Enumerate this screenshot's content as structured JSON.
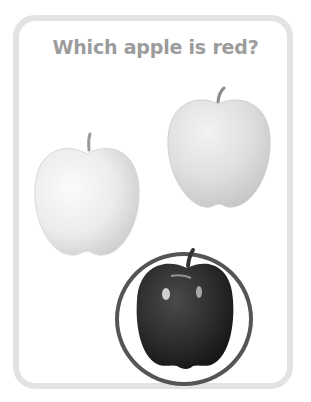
{
  "question": "Which apple is red?",
  "options": [
    {
      "id": "apple-1",
      "label": "pale apple (left)",
      "color": "#e8e8e8",
      "selected": false
    },
    {
      "id": "apple-2",
      "label": "pale apple (right)",
      "color": "#dcdcdc",
      "selected": false
    },
    {
      "id": "apple-3",
      "label": "red apple",
      "color": "#2a2a2a",
      "selected": true
    }
  ],
  "colors": {
    "card_border": "#e3e3e3",
    "question_text": "#9c9c9c",
    "selection_ring": "#555555"
  }
}
